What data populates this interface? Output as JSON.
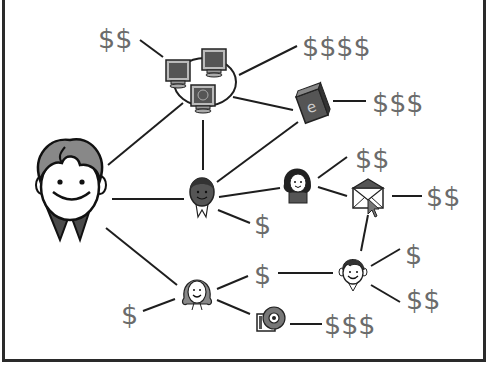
{
  "diagram": {
    "type": "network",
    "nodes": [
      {
        "id": "main-person",
        "kind": "boy-face-large"
      },
      {
        "id": "computers",
        "kind": "computer-network"
      },
      {
        "id": "ebook",
        "kind": "book",
        "glyph": "e"
      },
      {
        "id": "dark-girl",
        "kind": "person-dark"
      },
      {
        "id": "girl",
        "kind": "person-girl"
      },
      {
        "id": "envelope",
        "kind": "email"
      },
      {
        "id": "blonde-woman",
        "kind": "person-woman"
      },
      {
        "id": "small-boy",
        "kind": "person-boy"
      },
      {
        "id": "cd",
        "kind": "cd-disc"
      }
    ],
    "labels": {
      "computers_value": "$$",
      "computers_value_right": "$$$$",
      "ebook_value": "$$$",
      "girl_value": "$$",
      "envelope_value": "$$",
      "dark_girl_value": "$",
      "blonde_woman_value": "$",
      "middle_value": "$",
      "small_boy_value_top": "$",
      "small_boy_value_bottom": "$$",
      "cd_value": "$$$"
    },
    "colors": {
      "text": "#6b6b6b",
      "lines": "#1e1e1e",
      "frame": "#2a2a2a",
      "hair": "#7a7a7a",
      "dark": "#4a4a4a"
    }
  }
}
